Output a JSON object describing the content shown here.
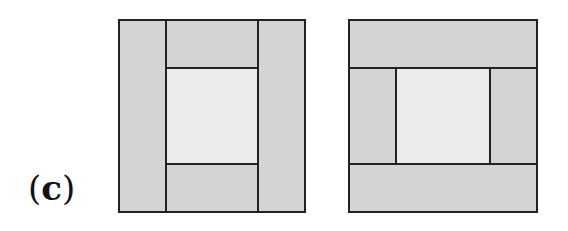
{
  "label": {
    "open": "(",
    "letter": "c",
    "close": ")"
  },
  "colors": {
    "outer": "#d4d4d4",
    "inner": "#ececec",
    "stroke": "#222222"
  },
  "diagrams": [
    {
      "id": "left",
      "layout": "vertical-side-strips"
    },
    {
      "id": "right",
      "layout": "horizontal-top-bottom-strips"
    }
  ]
}
